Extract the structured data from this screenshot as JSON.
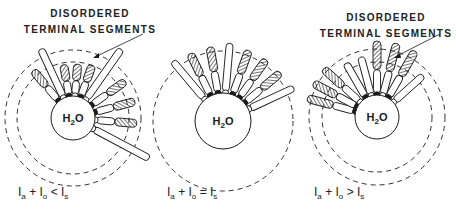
{
  "panels": [
    {
      "id": "left",
      "label_line1": "DISORDERED",
      "label_line2": "TERMINAL SEGMENTS",
      "core_label": "H2O",
      "condition": {
        "a": "I",
        "a_sub": "a",
        "plus": "+",
        "o": "I",
        "o_sub": "o",
        "op": "<",
        "s": "I",
        "s_sub": "s"
      },
      "center": [
        73,
        118
      ],
      "core_r": 22,
      "dashed_r": [
        68,
        56
      ]
    },
    {
      "id": "middle",
      "core_label": "H2O",
      "condition": {
        "a": "I",
        "a_sub": "a",
        "plus": "+",
        "o": "I",
        "o_sub": "o",
        "op": "=",
        "s": "I",
        "s_sub": "s"
      },
      "center": [
        223,
        121
      ],
      "core_r": 28,
      "dashed_r": [
        70
      ]
    },
    {
      "id": "right",
      "label_line1": "DISORDERED",
      "label_line2": "TERMINAL SEGMENTS",
      "core_label": "H2O",
      "condition": {
        "a": "I",
        "a_sub": "a",
        "plus": "+",
        "o": "I",
        "o_sub": "o",
        "op": ">",
        "s": "I",
        "s_sub": "s"
      },
      "center": [
        377,
        117
      ],
      "core_r": 22,
      "dashed_r": [
        68,
        55
      ]
    }
  ],
  "colors": {
    "ink": "#1a1a1a",
    "background": "#ffffff"
  }
}
